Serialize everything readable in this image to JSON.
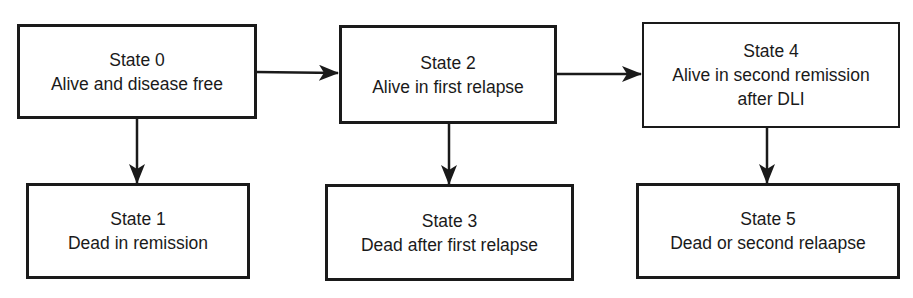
{
  "diagram": {
    "type": "state-transition",
    "states": [
      {
        "id": 0,
        "title": "State 0",
        "lines": [
          "Alive and disease free"
        ]
      },
      {
        "id": 1,
        "title": "State 1",
        "lines": [
          "Dead in remission"
        ]
      },
      {
        "id": 2,
        "title": "State 2",
        "lines": [
          "Alive in first relapse"
        ]
      },
      {
        "id": 3,
        "title": "State 3",
        "lines": [
          "Dead after first relapse"
        ]
      },
      {
        "id": 4,
        "title": "State 4",
        "lines": [
          "Alive in second remission",
          "after DLI"
        ]
      },
      {
        "id": 5,
        "title": "State 5",
        "lines": [
          "Dead or second relaapse"
        ]
      }
    ],
    "transitions": [
      {
        "from": 0,
        "to": 2
      },
      {
        "from": 2,
        "to": 4
      },
      {
        "from": 0,
        "to": 1
      },
      {
        "from": 2,
        "to": 3
      },
      {
        "from": 4,
        "to": 5
      }
    ],
    "colors": {
      "stroke": "#1a1a1a",
      "background": "#ffffff"
    }
  }
}
